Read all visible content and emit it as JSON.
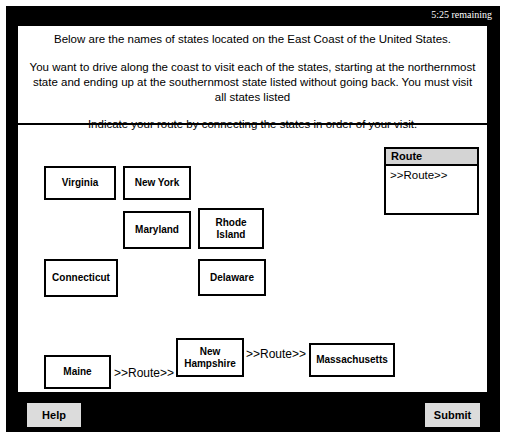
{
  "timer": {
    "label": "5:25 remaining"
  },
  "instructions": {
    "line1": "Below are the names of states located on the East Coast of the United States.",
    "line2": "You want to drive along the coast to visit each of the states, starting at the northernmost state and ending up at the southernmost state listed without going back.  You must visit all states listed",
    "line3": "Indicate your route by connecting the states in order of your visit."
  },
  "states": [
    {
      "name": "Virginia"
    },
    {
      "name": "New York"
    },
    {
      "name": "Maryland"
    },
    {
      "name": "Rhode Island"
    },
    {
      "name": "Connecticut"
    },
    {
      "name": "Delaware"
    },
    {
      "name": "Maine"
    },
    {
      "name": "New Hampshire"
    },
    {
      "name": "Massachusetts"
    }
  ],
  "connectors": [
    {
      "label": ">>Route>>"
    },
    {
      "label": ">>Route>>"
    }
  ],
  "route_panel": {
    "header": "Route",
    "body": ">>Route>>"
  },
  "footer": {
    "help_label": "Help",
    "submit_label": "Submit"
  },
  "colors": {
    "frame": "#000000",
    "panel": "#ffffff",
    "button": "#dcdcdc",
    "route_header": "#d4d4d4",
    "text": "#000000",
    "timer_text": "#ffffff"
  }
}
